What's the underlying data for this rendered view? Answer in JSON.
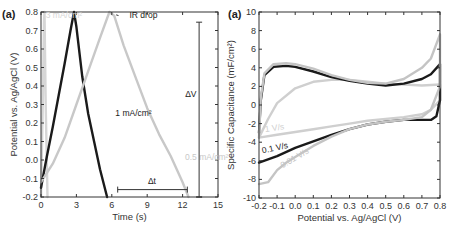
{
  "chart_data": [
    {
      "type": "line",
      "panel_label": "(a)",
      "title": "",
      "xlabel": "Time (s)",
      "ylabel": "Potential vs. Ag/AgCl (V)",
      "xlim": [
        0,
        15
      ],
      "ylim": [
        -0.2,
        0.8
      ],
      "xticks": [
        0,
        3,
        6,
        9,
        12,
        15
      ],
      "yticks": [
        -0.2,
        -0.1,
        0.0,
        0.1,
        0.2,
        0.3,
        0.4,
        0.5,
        0.6,
        0.7,
        0.8
      ],
      "ytick_labels": [
        "-0.2",
        "-0.1",
        "0.0",
        "0.1",
        "0.2",
        "0.3",
        "0.4",
        "0.5",
        "0.6",
        "0.7",
        "0.8"
      ],
      "grid": false,
      "series": [
        {
          "name": "3 mA/cm²",
          "color": "#d6d6d6",
          "x": [
            0.0,
            0.15,
            0.25,
            0.3,
            0.4,
            0.55
          ],
          "y": [
            -0.2,
            0.3,
            0.75,
            0.8,
            0.3,
            -0.2
          ]
        },
        {
          "name": "1 mA/cm²",
          "color": "#1a1a1a",
          "x": [
            0.0,
            0.5,
            1.0,
            1.5,
            2.0,
            2.5,
            2.8,
            3.0,
            3.5,
            4.0,
            4.5,
            5.0,
            5.6
          ],
          "y": [
            -0.15,
            0.02,
            0.18,
            0.35,
            0.52,
            0.7,
            0.8,
            0.72,
            0.45,
            0.25,
            0.1,
            -0.05,
            -0.2
          ]
        },
        {
          "name": "0.5 mA/cm²",
          "color": "#c8c8c8",
          "x": [
            0.0,
            1.0,
            2.0,
            3.0,
            4.0,
            5.0,
            5.8,
            6.2,
            7.0,
            8.0,
            9.0,
            10.0,
            11.0,
            12.0,
            12.5
          ],
          "y": [
            -0.12,
            -0.02,
            0.12,
            0.3,
            0.48,
            0.66,
            0.8,
            0.78,
            0.62,
            0.45,
            0.28,
            0.14,
            0.02,
            -0.12,
            -0.2
          ]
        }
      ],
      "annotations": [
        {
          "text": "3 mA/cm²",
          "x": 0.4,
          "y": 0.77,
          "color": "#d6d6d6"
        },
        {
          "text": "IR drop",
          "x": 7.5,
          "y": 0.77,
          "color": "#1a1a1a",
          "arrow_to": [
            6.2,
            0.79
          ]
        },
        {
          "text": "1 mA/cm²",
          "x": 6.3,
          "y": 0.24,
          "color": "#1a1a1a"
        },
        {
          "text": "0.5 mA/cm²",
          "x": 12.2,
          "y": 0.0,
          "color": "#c8c8c8"
        },
        {
          "text": "Δt",
          "x": 9.4,
          "y": -0.13,
          "color": "#1a1a1a",
          "bracket": {
            "x1": 6.5,
            "x2": 12.4,
            "y": -0.16
          }
        },
        {
          "text": "ΔV",
          "x": 12.7,
          "y": 0.34,
          "color": "#1a1a1a",
          "bracket": {
            "x": 13.4,
            "y1": -0.2,
            "y2": 0.745
          }
        }
      ]
    },
    {
      "type": "line",
      "panel_label": "(a)",
      "title": "",
      "xlabel": "Potential vs. Ag/AgCl (V)",
      "ylabel": "Specific Capacitance (mF/cm²)",
      "xlim": [
        -0.2,
        0.8
      ],
      "ylim": [
        -10,
        10
      ],
      "xticks": [
        -0.2,
        -0.1,
        0.0,
        0.1,
        0.2,
        0.3,
        0.4,
        0.5,
        0.6,
        0.7,
        0.8
      ],
      "xtick_labels": [
        "-0.2",
        "-0.1",
        "0.0",
        "0.1",
        "0.2",
        "0.3",
        "0.4",
        "0.5",
        "0.6",
        "0.7",
        "0.8"
      ],
      "yticks": [
        -10,
        -8,
        -6,
        -4,
        -2,
        0,
        2,
        4,
        6,
        8,
        10
      ],
      "grid": false,
      "series": [
        {
          "name": "1 V/s",
          "color": "#cfcfcf",
          "x": [
            -0.2,
            -0.15,
            -0.1,
            0.0,
            0.1,
            0.2,
            0.3,
            0.4,
            0.5,
            0.6,
            0.7,
            0.8,
            0.8,
            0.75,
            0.7,
            0.6,
            0.5,
            0.4,
            0.3,
            0.2,
            0.1,
            0.0,
            -0.1,
            -0.2
          ],
          "y": [
            -3.5,
            -1.5,
            0.2,
            1.8,
            2.5,
            2.7,
            2.7,
            2.5,
            2.3,
            2.2,
            2.1,
            2.2,
            0.5,
            -0.5,
            -1.0,
            -1.3,
            -1.5,
            -1.7,
            -2.0,
            -2.3,
            -2.6,
            -2.9,
            -3.2,
            -3.5
          ]
        },
        {
          "name": "0.1 V/s",
          "color": "#1a1a1a",
          "x": [
            -0.2,
            -0.19,
            -0.17,
            -0.12,
            -0.05,
            0.0,
            0.1,
            0.2,
            0.3,
            0.4,
            0.5,
            0.6,
            0.7,
            0.75,
            0.8,
            0.8,
            0.78,
            0.75,
            0.7,
            0.6,
            0.5,
            0.4,
            0.3,
            0.2,
            0.1,
            0.0,
            -0.1,
            -0.2
          ],
          "y": [
            -3.0,
            0.5,
            3.2,
            4.1,
            4.2,
            4.1,
            3.6,
            3.0,
            2.6,
            2.3,
            2.1,
            2.3,
            2.8,
            3.3,
            4.4,
            0.5,
            -1.2,
            -1.6,
            -1.6,
            -1.6,
            -1.8,
            -2.1,
            -2.6,
            -3.2,
            -3.9,
            -4.6,
            -5.5,
            -6.2
          ]
        },
        {
          "name": "0.01 V/s",
          "color": "#c4c4c4",
          "x": [
            -0.2,
            -0.19,
            -0.17,
            -0.12,
            -0.05,
            0.0,
            0.1,
            0.2,
            0.3,
            0.4,
            0.5,
            0.6,
            0.7,
            0.75,
            0.8,
            0.8,
            0.75,
            0.7,
            0.6,
            0.5,
            0.4,
            0.3,
            0.2,
            0.1,
            0.0,
            -0.05,
            -0.1,
            -0.15,
            -0.2
          ],
          "y": [
            -3.5,
            0.8,
            3.4,
            4.4,
            4.5,
            4.4,
            3.9,
            3.2,
            2.7,
            2.4,
            2.3,
            2.8,
            4.0,
            5.0,
            7.6,
            2.0,
            -0.5,
            -1.3,
            -1.6,
            -1.8,
            -2.1,
            -2.6,
            -3.4,
            -4.4,
            -5.6,
            -6.2,
            -7.0,
            -8.3,
            -8.5
          ]
        }
      ],
      "annotations": [
        {
          "text": "1 V/s",
          "x": -0.165,
          "y": -2.9,
          "color": "#cfcfcf"
        },
        {
          "text": "0.1 V/s",
          "x": -0.18,
          "y": -5.2,
          "color": "#1a1a1a"
        },
        {
          "text": "0.01 V/s",
          "x": -0.07,
          "y": -6.8,
          "color": "#c4c4c4"
        }
      ]
    }
  ]
}
